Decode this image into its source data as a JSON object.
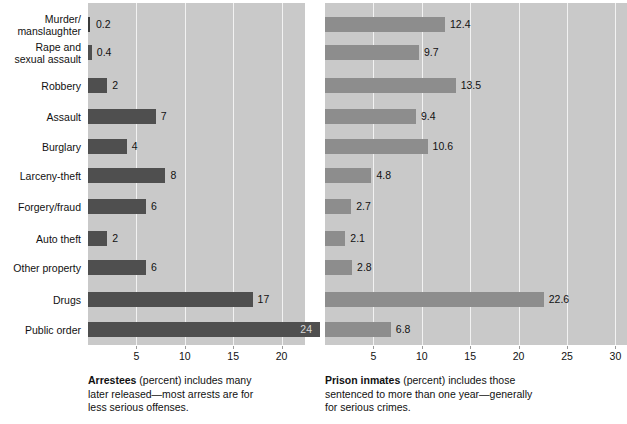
{
  "chart_data": {
    "type": "bar",
    "title": "",
    "orientation": "horizontal",
    "grid": true,
    "legend_position": "none",
    "categories": [
      "Murder/\nmanslaughter",
      "Rape and\nsexual assault",
      "Robbery",
      "Assault",
      "Burglary",
      "Larceny-theft",
      "Forgery/fraud",
      "Auto theft",
      "Other property",
      "Drugs",
      "Public order"
    ],
    "series": [
      {
        "name": "Arrestees",
        "values": [
          0.2,
          0.4,
          2,
          7,
          4,
          8,
          6,
          2,
          6,
          17,
          24
        ],
        "value_labels": [
          "0.2",
          "0.4",
          "2",
          "7",
          "4",
          "8",
          "6",
          "2",
          "6",
          "17",
          "24"
        ],
        "color": "#4f4f4f",
        "xlim": [
          0,
          24
        ],
        "ticks": [
          5,
          10,
          15,
          20
        ],
        "tick_labels": [
          "5",
          "10",
          "15",
          "20"
        ],
        "xlabel": "",
        "ylabel": ""
      },
      {
        "name": "Prison inmates",
        "values": [
          12.4,
          9.7,
          13.5,
          9.4,
          10.6,
          4.8,
          2.7,
          2.1,
          2.8,
          22.6,
          6.8
        ],
        "value_labels": [
          "12.4",
          "9.7",
          "13.5",
          "9.4",
          "10.6",
          "4.8",
          "2.7",
          "2.1",
          "2.8",
          "22.6",
          "6.8"
        ],
        "color": "#8d8d8d",
        "xlim": [
          0,
          31
        ],
        "ticks": [
          5,
          10,
          15,
          20,
          25,
          30
        ],
        "tick_labels": [
          "5",
          "10",
          "15",
          "20",
          "25",
          "30"
        ],
        "xlabel": "",
        "ylabel": ""
      }
    ]
  },
  "captions": {
    "left": {
      "bold": "Arrestees",
      "rest": " (percent) includes many later released—most arrests are for less serious offenses."
    },
    "right": {
      "bold": "Prison inmates",
      "rest": " (percent) includes those sentenced to more than one year—generally for serious crimes."
    }
  },
  "colors": {
    "plot_background": "#c9c9c9",
    "gridline": "#f2f2f2",
    "bar_left": "#4f4f4f",
    "bar_right": "#8d8d8d",
    "text": "#111111",
    "page_background": "#ffffff"
  }
}
